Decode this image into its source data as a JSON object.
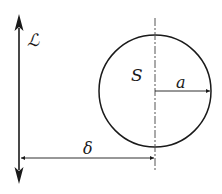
{
  "diagram": {
    "labels": {
      "line": "ℒ",
      "region": "S",
      "radius": "a",
      "distance": "δ"
    },
    "geometry": {
      "line_x": 19,
      "line_top": 14,
      "line_bottom": 184,
      "circle_cx": 155,
      "circle_cy": 91,
      "circle_r": 56,
      "center_axis_top": 18,
      "center_axis_bottom": 172,
      "radius_arrow_y": 91,
      "distance_arrow_y": 158
    },
    "colors": {
      "stroke": "#1a1a1a",
      "dashed": "#555555",
      "background": "#ffffff"
    }
  }
}
